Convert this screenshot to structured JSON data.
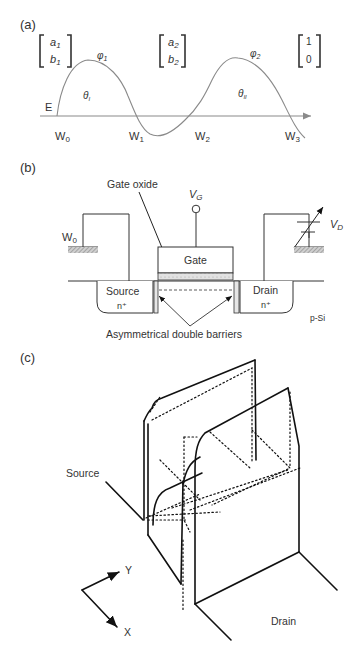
{
  "panel_a": {
    "label": "(a)",
    "vectors": [
      {
        "top": "a",
        "top_sub": "1",
        "bottom": "b",
        "bottom_sub": "1"
      },
      {
        "top": "a",
        "top_sub": "2",
        "bottom": "b",
        "bottom_sub": "2"
      },
      {
        "top": "1",
        "top_sub": "",
        "bottom": "0",
        "bottom_sub": ""
      }
    ],
    "phi1": "φ",
    "phi1_sub": "1",
    "phi2": "φ",
    "phi2_sub": "2",
    "theta1": "θ",
    "theta1_sub": "I",
    "theta2": "θ",
    "theta2_sub": "II",
    "energy_label": "E",
    "w_labels": [
      {
        "main": "W",
        "sub": "0"
      },
      {
        "main": "W",
        "sub": "1"
      },
      {
        "main": "W",
        "sub": "2"
      },
      {
        "main": "W",
        "sub": "3"
      }
    ],
    "colors": {
      "curve": "#8a8a8a",
      "axis": "#8a8a8a"
    }
  },
  "panel_b": {
    "label": "(b)",
    "gate_oxide_label": "Gate oxide",
    "vg_label": "V",
    "vg_sub": "G",
    "vd_label": "V",
    "vd_sub": "D",
    "w0_label": "W",
    "w0_sub": "0",
    "gate_label": "Gate",
    "source_label": "Source",
    "source_doping": "n⁺",
    "drain_label": "Drain",
    "drain_doping": "n⁺",
    "substrate_label": "p-Si",
    "barriers_label": "Asymmetrical double barriers"
  },
  "panel_c": {
    "label": "(c)",
    "source_label": "Source",
    "drain_label": "Drain",
    "axis_y": "Y",
    "axis_x": "X"
  }
}
